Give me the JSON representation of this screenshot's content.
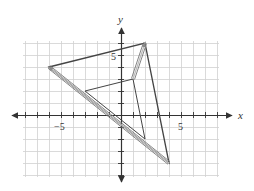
{
  "axes": {
    "x_label": "x",
    "y_label": "y",
    "x_tick_label": "5",
    "x_neg_tick_label": "−5",
    "y_tick_label": "5",
    "origin_px": [
      121,
      115
    ],
    "unit_px": 12,
    "grid_x_range": [
      -8,
      8
    ],
    "grid_y_range": [
      -5,
      6
    ]
  },
  "shapes": {
    "large_triangle": [
      [
        -6,
        4
      ],
      [
        2,
        6
      ],
      [
        4,
        -4
      ]
    ],
    "small_triangle": [
      [
        -3,
        2
      ],
      [
        1,
        3
      ],
      [
        2,
        -2
      ]
    ],
    "arrows": [
      {
        "from": [
          4,
          -4
        ],
        "to": [
          -6,
          4
        ],
        "style": "double"
      },
      {
        "from": [
          1,
          3
        ],
        "to": [
          2,
          6
        ],
        "style": "double"
      }
    ]
  },
  "colors": {
    "grid": "#d0d0d0",
    "axis": "#333333",
    "shape": "#444444"
  }
}
